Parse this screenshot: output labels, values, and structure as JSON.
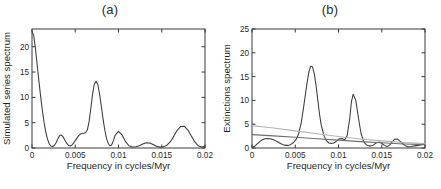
{
  "figure": {
    "background": "#ffffff",
    "line_color": "#3b3b3b",
    "ref_color_light": "#b4b4b4",
    "ref_color_dark": "#6e6e6e",
    "axis_color": "#3a3a3a"
  },
  "panels": [
    {
      "id": "a",
      "title": "(a)",
      "chart_data": {
        "type": "line",
        "title": "(a)",
        "xlabel": "Frequency in cycles/Myr",
        "ylabel": "Simulated series spectrum",
        "xlim": [
          0,
          0.02
        ],
        "ylim": [
          0,
          23.5
        ],
        "xticks": [
          0,
          0.005,
          0.01,
          0.015,
          0.02
        ],
        "xticklabels": [
          "0",
          "0.005",
          "0.01",
          "0.015",
          "0.02"
        ],
        "yticks": [
          0,
          5,
          10,
          15,
          20
        ],
        "yticklabels": [
          "0",
          "5",
          "10",
          "15",
          "20"
        ],
        "grid": false,
        "legend": "none",
        "series": [
          {
            "name": "Simulated series spectrum",
            "color": "#3b3b3b",
            "x": [
              0.0,
              0.0002,
              0.0004,
              0.0006,
              0.0008,
              0.001,
              0.0012,
              0.0014,
              0.0016,
              0.0018,
              0.002,
              0.0022,
              0.0024,
              0.0026,
              0.0028,
              0.003,
              0.0032,
              0.0034,
              0.0036,
              0.0038,
              0.004,
              0.0042,
              0.0044,
              0.0046,
              0.0048,
              0.005,
              0.0052,
              0.0054,
              0.0056,
              0.0058,
              0.006,
              0.0062,
              0.0064,
              0.0066,
              0.0068,
              0.007,
              0.0072,
              0.0074,
              0.0076,
              0.0078,
              0.008,
              0.0082,
              0.0084,
              0.0086,
              0.0088,
              0.009,
              0.0092,
              0.0094,
              0.0096,
              0.01,
              0.0104,
              0.0108,
              0.0112,
              0.0116,
              0.012,
              0.0124,
              0.0128,
              0.0132,
              0.0136,
              0.014,
              0.0144,
              0.0148,
              0.0152,
              0.0156,
              0.016,
              0.0164,
              0.0168,
              0.0172,
              0.0176,
              0.018,
              0.0184,
              0.0188,
              0.0192,
              0.0196,
              0.02
            ],
            "y": [
              23.0,
              22.2,
              19.6,
              16.4,
              13.2,
              10.2,
              7.4,
              5.0,
              3.1,
              1.7,
              0.8,
              0.35,
              0.3,
              0.55,
              1.1,
              1.85,
              2.45,
              2.55,
              2.2,
              1.55,
              0.95,
              0.55,
              0.4,
              0.55,
              0.95,
              1.45,
              1.95,
              2.45,
              2.75,
              2.85,
              2.9,
              3.05,
              3.6,
              5.2,
              7.8,
              10.6,
              12.6,
              13.2,
              12.6,
              10.8,
              8.4,
              5.9,
              3.7,
              2.0,
              0.95,
              0.45,
              0.6,
              1.4,
              2.5,
              3.3,
              2.6,
              1.3,
              0.45,
              0.2,
              0.25,
              0.45,
              0.8,
              1.05,
              1.0,
              0.7,
              0.35,
              0.18,
              0.22,
              0.55,
              1.25,
              2.35,
              3.55,
              4.25,
              4.3,
              3.6,
              2.4,
              1.25,
              0.45,
              0.2,
              0.35
            ]
          },
          {
            "name": "Simulated series spectrum tail",
            "color": "#3b3b3b",
            "x": [
              0.02,
              0.02
            ],
            "y": [
              0.35,
              0.35
            ]
          }
        ],
        "extra_series": [
          {
            "name": "low-peak-2",
            "color": "#3b3b3b",
            "x": [
              0.0155,
              0.016,
              0.0165,
              0.0172,
              0.018,
              0.0188,
              0.0194,
              0.02
            ],
            "y": [
              0.6,
              1.25,
              2.6,
              4.25,
              3.6,
              1.25,
              0.25,
              1.05
            ]
          }
        ]
      }
    },
    {
      "id": "b",
      "title": "(b)",
      "chart_data": {
        "type": "line",
        "title": "(b)",
        "xlabel": "Frequency in cycles/Myr",
        "ylabel": "Extinctions spectrum",
        "xlim": [
          0,
          0.02
        ],
        "ylim": [
          0,
          25
        ],
        "xticks": [
          0,
          0.005,
          0.01,
          0.015,
          0.02
        ],
        "xticklabels": [
          "0",
          "0.005",
          "0.01",
          "0.015",
          "0.02"
        ],
        "yticks": [
          0,
          5,
          10,
          15,
          20,
          25
        ],
        "yticklabels": [
          "0",
          "5",
          "10",
          "15",
          "20",
          "25"
        ],
        "grid": false,
        "legend": "none",
        "series": [
          {
            "name": "Extinctions spectrum",
            "color": "#3b3b3b",
            "x": [
              0.0,
              0.0003,
              0.0006,
              0.0009,
              0.0012,
              0.0015,
              0.0018,
              0.0021,
              0.0024,
              0.0027,
              0.003,
              0.0033,
              0.0036,
              0.0039,
              0.0042,
              0.0045,
              0.0048,
              0.0051,
              0.0054,
              0.0057,
              0.006,
              0.0062,
              0.0064,
              0.0066,
              0.0068,
              0.007,
              0.0072,
              0.0074,
              0.0076,
              0.0078,
              0.008,
              0.0083,
              0.0086,
              0.0089,
              0.0092,
              0.0095,
              0.0098,
              0.0101,
              0.0104,
              0.0107,
              0.011,
              0.0113,
              0.0115,
              0.0117,
              0.012,
              0.0123,
              0.0126,
              0.0129,
              0.0132,
              0.0135,
              0.0138,
              0.0141,
              0.0144,
              0.0147,
              0.015,
              0.0153,
              0.0156,
              0.0159,
              0.0162,
              0.0165,
              0.0168,
              0.0172,
              0.0176,
              0.018,
              0.0184,
              0.0188,
              0.0192,
              0.0196,
              0.02
            ],
            "y": [
              0.1,
              0.35,
              0.85,
              1.35,
              1.75,
              1.95,
              2.0,
              1.95,
              1.8,
              1.55,
              1.25,
              0.95,
              0.7,
              0.55,
              0.55,
              0.75,
              1.15,
              1.8,
              3.0,
              5.4,
              9.0,
              11.6,
              14.1,
              16.2,
              17.2,
              17.0,
              15.6,
              13.2,
              10.2,
              7.2,
              4.8,
              2.7,
              1.55,
              1.05,
              0.95,
              1.1,
              1.5,
              1.95,
              2.0,
              1.7,
              2.6,
              6.2,
              9.8,
              11.3,
              10.0,
              6.4,
              3.1,
              1.4,
              0.7,
              0.45,
              0.45,
              0.7,
              1.1,
              1.25,
              1.0,
              0.55,
              0.3,
              0.55,
              1.25,
              1.85,
              1.9,
              1.3,
              0.6,
              0.25,
              0.3,
              0.45,
              0.55,
              0.7,
              1.0
            ]
          },
          {
            "name": "Confidence level upper",
            "color": "#b4b4b4",
            "x": [
              0.0,
              0.0025,
              0.005,
              0.0075,
              0.01,
              0.0125,
              0.015,
              0.0175,
              0.02
            ],
            "y": [
              4.7,
              4.2,
              3.6,
              3.0,
              2.4,
              1.9,
              1.5,
              1.15,
              0.95
            ]
          },
          {
            "name": "Confidence level lower",
            "color": "#6e6e6e",
            "x": [
              0.0,
              0.0025,
              0.005,
              0.0075,
              0.01,
              0.0125,
              0.015,
              0.0175,
              0.02
            ],
            "y": [
              2.8,
              2.55,
              2.25,
              1.95,
              1.65,
              1.35,
              1.1,
              0.85,
              0.7
            ]
          }
        ]
      }
    }
  ]
}
